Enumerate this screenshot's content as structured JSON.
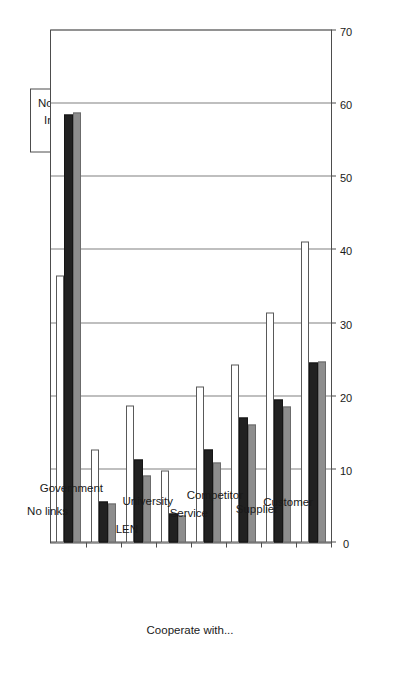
{
  "chart_data": {
    "type": "bar",
    "orientation": "vertical-rotated",
    "title": "",
    "xlabel": "Cooperate with...",
    "ylabel": "% of firms",
    "categories": [
      "No links",
      "Government",
      "LEN",
      "University",
      "Service",
      "Competitor",
      "Supplier",
      "Customer"
    ],
    "series": [
      {
        "name": "Novel",
        "color": "#ffffff",
        "values": [
          36.5,
          12.7,
          18.7,
          9.8,
          21.3,
          24.3,
          31.5,
          41.2
        ]
      },
      {
        "name": "Incremental",
        "color": "#212121",
        "values": [
          58.5,
          5.6,
          11.3,
          4.0,
          12.7,
          17.1,
          19.6,
          24.6
        ]
      },
      {
        "name": "Non-innovator",
        "color": "#8d8d8d",
        "values": [
          58.8,
          5.4,
          9.2,
          3.7,
          11.0,
          16.2,
          18.6,
          24.8
        ]
      }
    ],
    "ylim": [
      0,
      70
    ],
    "yticks": [
      0,
      10,
      20,
      30,
      40,
      50,
      60,
      70
    ],
    "ytick_labels": [
      "0",
      "10",
      "20",
      "30",
      "40",
      "50",
      "60",
      "70"
    ],
    "grid": true,
    "legend_position": "top-right",
    "legend_entries": [
      "Novel",
      "Incremental",
      "Non-innovator"
    ]
  }
}
